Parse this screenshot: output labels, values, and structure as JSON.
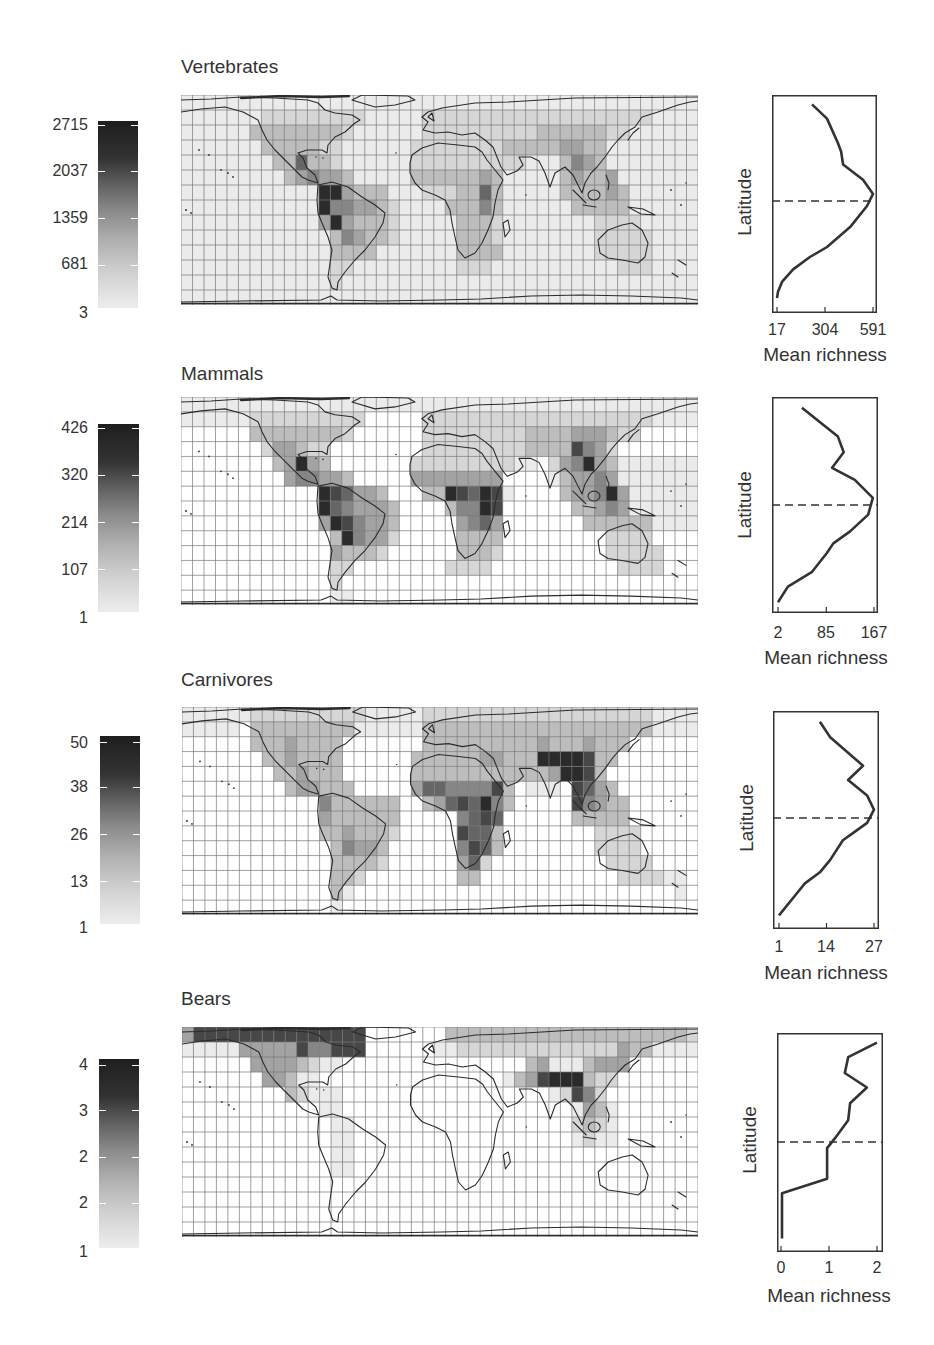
{
  "figure": {
    "description_panels": [
      "Vertebrates",
      "Mammals",
      "Carnivores",
      "Bears"
    ]
  },
  "shade_palette": [
    "#ffffff",
    "#ebebeb",
    "#d6d6d6",
    "#bdbdbd",
    "#a3a3a3",
    "#868686",
    "#666666",
    "#474747",
    "#2b2b2b"
  ],
  "colors": {
    "gridline": "#767676",
    "coastline": "#2b2b2b",
    "profile_line": "#333333",
    "text": "#333333"
  },
  "chart_data": [
    {
      "type": "heatmap",
      "title": "Vertebrates",
      "colorbar": {
        "tick_labels": [
          "2715",
          "2037",
          "1359",
          "681",
          "3"
        ],
        "range": [
          3,
          2715
        ]
      },
      "map": {
        "cols": 45,
        "rows": 14,
        "shade_rows": [
          "111111111111111111111111111111111111111111111",
          "111111122222222211111222222222222222222221111",
          "111111333333332111111222222222233333322111111",
          "111111133333221111112222222233333443311111111",
          "111111113363321111112222222222111354311111111",
          "111111111345443111113333334311111343341111111",
          "111111111111884333111222336311111333343111111",
          "111111111111855443211113335311111133333111111",
          "111111111111484333211111333211111111222211111",
          "111111111111135433211111333211111111222221111",
          "111111111111133331111111333311111111222221111",
          "111111111111122111111111222111111111112221111",
          "111111111111121111111111111111111111111111111",
          "111111111111111111111111111111111111111111111"
        ]
      },
      "profile": {
        "type": "line",
        "xlabel": "Mean richness",
        "ylabel": "Latitude",
        "xticks": [
          17,
          304,
          591
        ],
        "xtick_labels": [
          "17",
          "304",
          "591"
        ],
        "xlim": [
          17,
          591
        ],
        "equator_line": "dashed",
        "richness": [
          226,
          316,
          382,
          400,
          412,
          531,
          591,
          555,
          454,
          316,
          214,
          113,
          47,
          23,
          17
        ],
        "latitude": [
          82,
          70,
          49,
          42,
          31,
          18,
          6,
          -4,
          -21,
          -37,
          -45,
          -55,
          -65,
          -73,
          -78
        ]
      }
    },
    {
      "type": "heatmap",
      "title": "Mammals",
      "colorbar": {
        "tick_labels": [
          "426",
          "320",
          "214",
          "107",
          "1"
        ],
        "range": [
          1,
          426
        ]
      },
      "map": {
        "cols": 45,
        "rows": 14,
        "shade_rows": [
          "111111111111111111111111111111111111111111111",
          "111111222222222200000222222222222222222221111",
          "000000333333332000000222222222333344432200000",
          "000000024432200000000222222222333375420000000",
          "000000003484300000002222222221102458431111111",
          "000000000455443000004444444400001344541111111",
          "000000000000876443000338768710000344584111111",
          "000000000000865444300003558700000033454111111",
          "000000000000487544300000456400000003333331111",
          "000000000000038544200000333300000000022220000",
          "000000000000043332000000333200000000022222000",
          "000000000000022000000002222000000000002222000",
          "000000000000020000000000000000000000000000000",
          "000000000000011000000000000000000000000000000"
        ]
      },
      "profile": {
        "type": "line",
        "xlabel": "Mean richness",
        "ylabel": "Latitude",
        "xticks": [
          2,
          85,
          167
        ],
        "xtick_labels": [
          "2",
          "85",
          "167"
        ],
        "xlim": [
          2,
          167
        ],
        "equator_line": "dashed",
        "richness": [
          43,
          105,
          115,
          95,
          134,
          165,
          157,
          126,
          97,
          86,
          60,
          19,
          2
        ],
        "latitude": [
          81,
          57,
          44,
          31,
          21,
          6,
          -8,
          -22,
          -32,
          -40,
          -56,
          -68,
          -81
        ]
      }
    },
    {
      "type": "heatmap",
      "title": "Carnivores",
      "colorbar": {
        "tick_labels": [
          "50",
          "38",
          "26",
          "13",
          "1"
        ],
        "range": [
          1,
          50
        ]
      },
      "map": {
        "cols": 45,
        "rows": 14,
        "shade_rows": [
          "111111222222222211111222222222222222222221111",
          "111110333333333111111333333333333333333331111",
          "000000333433330000000333333333343334333000000",
          "000000033433330000003333334433388887330000000",
          "000000003343330000003333333333334887300000000",
          "000000000344333000004665555730111076430000000",
          "000000000000533333300346768530000075433000000",
          "000000000000433333300000567600000033333000000",
          "000000000000334333200000766300000000222200000",
          "000000000000035443000000576300000000222200000",
          "000000000000033332000000462000000000022220000",
          "000000000000033200000000330000000000002222110",
          "000000000000031000000000000000000000000000010",
          "000000000000010000000000000000000000000000000"
        ]
      },
      "profile": {
        "type": "line",
        "xlabel": "Mean richness",
        "ylabel": "Latitude",
        "xticks": [
          1,
          14,
          27
        ],
        "xtick_labels": [
          "1",
          "14",
          "27"
        ],
        "xlim": [
          1,
          27
        ],
        "equator_line": "dashed",
        "richness": [
          12.2,
          15.0,
          24.0,
          19.9,
          25.1,
          27.0,
          25.1,
          21.8,
          18.5,
          15.0,
          12.2,
          8.1,
          5.9,
          1.0
        ],
        "latitude": [
          81,
          68,
          44,
          32,
          19,
          7,
          -4,
          -11,
          -18,
          -34,
          -44,
          -53,
          -61,
          -79
        ]
      }
    },
    {
      "type": "heatmap",
      "title": "Bears",
      "colorbar": {
        "tick_labels": [
          "4",
          "3",
          "2",
          "2",
          "1"
        ],
        "range": [
          1,
          4
        ]
      },
      "map": {
        "cols": 45,
        "rows": 14,
        "shade_rows": [
          "477777777777777700000003333333333333333333332",
          "111114444475577700000011222222222222224331111",
          "000000444432110000000000000000341113444000000",
          "000000044311000000000000000013478883220000000",
          "000000000321110000000000000000001275200000000",
          "000000000000110000000000000000000014310000000",
          "000000000000011000000000000000000023210000000",
          "000000000000011000000000000000000012110000000",
          "000000000000011000000000000000000000000000000",
          "000000000000011000000000000000000000000000000",
          "000000000000000000000000000000000000000000000",
          "000000000000000000000000000000000000000000000",
          "000000000000000000000000000000000000000000000",
          "000000000000000000000000000000000000000000000"
        ]
      },
      "profile": {
        "type": "line",
        "xlabel": "Mean richness",
        "ylabel": "Latitude",
        "xticks": [
          0,
          1,
          2
        ],
        "xtick_labels": [
          "0",
          "1",
          "2"
        ],
        "xlim": [
          0,
          2
        ],
        "equator_line": "dashed",
        "richness": [
          2.0,
          1.4,
          1.33,
          1.79,
          1.44,
          1.4,
          1.12,
          0.96,
          0.96,
          0.02,
          0.02
        ],
        "latitude": [
          82,
          70,
          57,
          45,
          32,
          18,
          3,
          -5,
          -30,
          -42,
          -79
        ]
      }
    }
  ]
}
